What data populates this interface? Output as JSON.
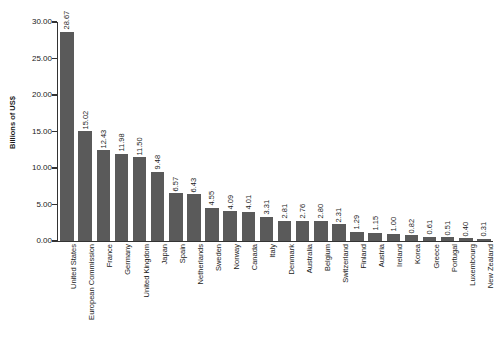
{
  "chart_data": {
    "type": "bar",
    "title": "",
    "xlabel": "",
    "ylabel": "Billions of US$",
    "ylim": [
      0.0,
      30.0
    ],
    "ytick_labels": [
      "0.00",
      "5.00",
      "10.00",
      "15.00",
      "20.00",
      "25.00",
      "30.00"
    ],
    "ytick_values": [
      0,
      5,
      10,
      15,
      20,
      25,
      30
    ],
    "grid": false,
    "legend": false,
    "bar_color": "#5a5a5a",
    "axis_color": "#333333",
    "background_color": "#ffffff",
    "value_labels_shown": true,
    "categories": [
      "United States",
      "European Commission",
      "France",
      "Germany",
      "United Kingdom",
      "Japan",
      "Spain",
      "Netherlands",
      "Sweden",
      "Norway",
      "Canada",
      "Italy",
      "Denmark",
      "Australia",
      "Belgium",
      "Switzerland",
      "Finland",
      "Austria",
      "Ireland",
      "Korea",
      "Greece",
      "Portugal",
      "Luxembourg",
      "New Zealand"
    ],
    "values": [
      28.67,
      15.02,
      12.43,
      11.98,
      11.5,
      9.48,
      6.57,
      6.43,
      4.55,
      4.09,
      4.01,
      3.31,
      2.81,
      2.76,
      2.8,
      2.31,
      1.29,
      1.15,
      1.0,
      0.82,
      0.61,
      0.51,
      0.4,
      0.31
    ],
    "value_labels": [
      "28.67",
      "15.02",
      "12.43",
      "11.98",
      "11.50",
      "9.48",
      "6.57",
      "6.43",
      "4.55",
      "4.09",
      "4.01",
      "3.31",
      "2.81",
      "2.76",
      "2.80",
      "2.31",
      "1.29",
      "1.15",
      "1.00",
      "0.82",
      "0.61",
      "0.51",
      "0.40",
      "0.31"
    ]
  }
}
